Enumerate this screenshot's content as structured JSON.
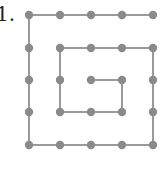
{
  "problem": {
    "label": "1."
  },
  "diagram": {
    "type": "dot-grid-spiral",
    "grid_size": 5,
    "x_coords": [
      29,
      60,
      91,
      122,
      153
    ],
    "y_coords": [
      15,
      48,
      80,
      112,
      145
    ],
    "dot_radius": 4.2,
    "line_width": 2,
    "colors": {
      "dot": "#8a8a8a",
      "line": "#9a9a9a"
    },
    "path": [
      [
        4,
        0
      ],
      [
        3,
        0
      ],
      [
        2,
        0
      ],
      [
        1,
        0
      ],
      [
        0,
        0
      ],
      [
        0,
        1
      ],
      [
        0,
        2
      ],
      [
        0,
        3
      ],
      [
        0,
        4
      ],
      [
        1,
        4
      ],
      [
        2,
        4
      ],
      [
        3,
        4
      ],
      [
        4,
        4
      ],
      [
        4,
        3
      ],
      [
        4,
        2
      ],
      [
        4,
        1
      ],
      [
        3,
        1
      ],
      [
        2,
        1
      ],
      [
        1,
        1
      ],
      [
        1,
        2
      ],
      [
        1,
        3
      ],
      [
        2,
        3
      ],
      [
        3,
        3
      ],
      [
        3,
        2
      ],
      [
        2,
        2
      ]
    ]
  }
}
